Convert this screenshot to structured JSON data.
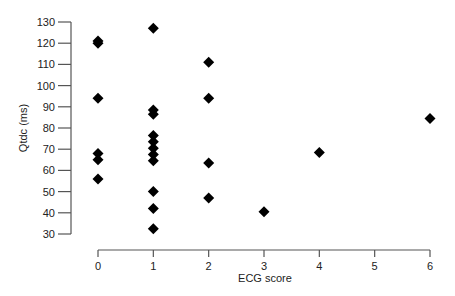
{
  "chart_data": {
    "type": "scatter",
    "title": "",
    "xlabel": "ECG score",
    "ylabel": "Qtdc (ms)",
    "xlim": [
      0,
      6
    ],
    "ylim": [
      30,
      130
    ],
    "xticks": [
      0,
      1,
      2,
      3,
      4,
      5,
      6
    ],
    "yticks": [
      30,
      40,
      50,
      60,
      70,
      80,
      90,
      100,
      110,
      120,
      130
    ],
    "grid": false,
    "legend": null,
    "marker": "diamond",
    "marker_color": "#000000",
    "series": [
      {
        "name": "Qtdc vs ECG score",
        "points": [
          {
            "x": 0,
            "y": 121
          },
          {
            "x": 0,
            "y": 120
          },
          {
            "x": 0,
            "y": 94
          },
          {
            "x": 0,
            "y": 68
          },
          {
            "x": 0,
            "y": 65
          },
          {
            "x": 0,
            "y": 56
          },
          {
            "x": 1,
            "y": 127
          },
          {
            "x": 1,
            "y": 88.5
          },
          {
            "x": 1,
            "y": 86.5
          },
          {
            "x": 1,
            "y": 76.5
          },
          {
            "x": 1,
            "y": 73.5
          },
          {
            "x": 1,
            "y": 70.5
          },
          {
            "x": 1,
            "y": 67.5
          },
          {
            "x": 1,
            "y": 64.5
          },
          {
            "x": 1,
            "y": 50
          },
          {
            "x": 1,
            "y": 42
          },
          {
            "x": 1,
            "y": 32.5
          },
          {
            "x": 2,
            "y": 111
          },
          {
            "x": 2,
            "y": 94
          },
          {
            "x": 2,
            "y": 63.5
          },
          {
            "x": 2,
            "y": 47
          },
          {
            "x": 3,
            "y": 40.5
          },
          {
            "x": 4,
            "y": 68.5
          },
          {
            "x": 6,
            "y": 84.5
          }
        ]
      }
    ]
  }
}
